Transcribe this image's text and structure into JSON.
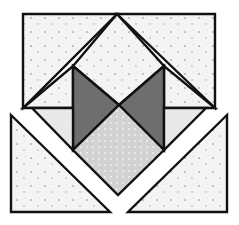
{
  "figure": {
    "width": 239,
    "height": 225,
    "colors": {
      "background": "#ffffff",
      "outline": "#111111",
      "light_fill": "#f4f4f4",
      "light_dots": "#b8b8b8",
      "medium_fill": "#d6d6d6",
      "medium_dots": "#f2f2f2",
      "pale_fill": "#e6e6e6",
      "dark_fill": "#6e6e6e"
    },
    "pieces": [
      {
        "name": "top-left-triangle",
        "fill": "light",
        "points": "23,14 117,14 23,108"
      },
      {
        "name": "top-center-diamond",
        "fill": "light",
        "points": "117,14 164,66 119,105 73,66"
      },
      {
        "name": "top-right-triangle",
        "fill": "light",
        "points": "117,14 215,14 215,108"
      },
      {
        "name": "upper-left-small-triangle",
        "fill": "light",
        "points": "23,108 73,66 73,108"
      },
      {
        "name": "upper-right-small-triangle",
        "fill": "light",
        "points": "215,108 164,66 164,108"
      },
      {
        "name": "left-dark-triangle",
        "fill": "dark",
        "points": "73,66 119,105 73,150"
      },
      {
        "name": "right-dark-triangle",
        "fill": "dark",
        "points": "164,66 164,150 119,105"
      },
      {
        "name": "center-bottom-diamond",
        "fill": "medium",
        "points": "119,105 164,150 118,195 73,150"
      },
      {
        "name": "left-pale-triangle",
        "fill": "pale",
        "points": "32,108 73,108 73,150"
      },
      {
        "name": "right-pale-triangle",
        "fill": "pale",
        "points": "164,108 206,108 164,150"
      },
      {
        "name": "bottom-left-triangle",
        "fill": "light",
        "points": "11,115 110,212 11,212"
      },
      {
        "name": "bottom-right-triangle",
        "fill": "light",
        "points": "227,115 227,212 128,212"
      }
    ]
  }
}
